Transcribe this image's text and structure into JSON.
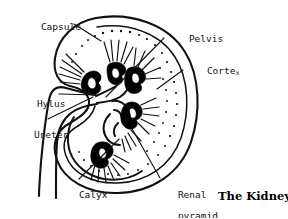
{
  "figure": {
    "title": "The Kidney",
    "caption_position": "bottom-right",
    "medium": "line-drawing",
    "ink_color": "#111111",
    "background_color": "#ffffff"
  },
  "labels": [
    {
      "id": "capsule",
      "text": "Capsule",
      "x": 18,
      "y": 16,
      "leader_from": [
        74,
        27
      ],
      "leader_to": [
        100,
        40
      ]
    },
    {
      "id": "pelvis",
      "text": "Pelvis",
      "x": 166,
      "y": 28,
      "leader_from": [
        163,
        40
      ],
      "leader_to": [
        106,
        96
      ]
    },
    {
      "id": "cortex",
      "text": "Corte",
      "text_tail": "x",
      "full_text": "Cortex",
      "x": 184,
      "y": 60,
      "leader_from": [
        182,
        72
      ],
      "leader_to": [
        158,
        88
      ]
    },
    {
      "id": "hylus",
      "text": "Hylus",
      "x": 17,
      "y": 92,
      "leader_from": [
        58,
        96
      ],
      "leader_to": [
        95,
        96
      ]
    },
    {
      "id": "ureter",
      "text": "Ureter",
      "x": 13,
      "y": 124,
      "leader_from": [
        48,
        121
      ],
      "leader_to": [
        92,
        98
      ]
    },
    {
      "id": "calyx",
      "text": "Calyx",
      "x": 56,
      "y": 183,
      "leader_from": [
        78,
        180
      ],
      "leader_to": [
        118,
        140
      ]
    },
    {
      "id": "renal-pyramid",
      "text": "Renal",
      "text_line2": "pyramid",
      "x": 155,
      "y": 183,
      "leader_from": [
        160,
        180
      ],
      "leader_to": [
        132,
        128
      ]
    }
  ],
  "anatomy": {
    "capsule_outline": "outer kidney bean-shaped border",
    "cortex_band": "inner parallel outline with stippled dots",
    "pyramid_count": 5,
    "pyramid_color": "#000000",
    "ray_groups": 6,
    "ureter": "two parallel lines descending from hilus"
  }
}
